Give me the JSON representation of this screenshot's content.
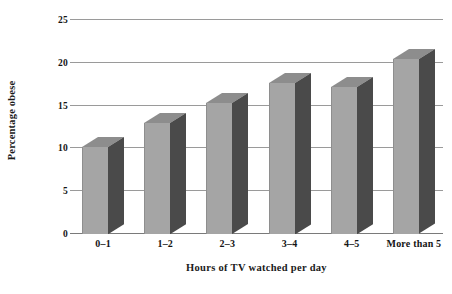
{
  "chart_data": {
    "type": "bar",
    "title": "",
    "subtitle": "",
    "xlabel": "Hours of TV watched per day",
    "ylabel": "Percentage obese",
    "categories": [
      "0–1",
      "1–2",
      "2–3",
      "3–4",
      "4–5",
      "More than 5"
    ],
    "values": [
      10.2,
      13.0,
      15.3,
      17.7,
      17.2,
      20.4
    ],
    "series": [
      {
        "name": "Percentage obese",
        "values": [
          10.2,
          13.0,
          15.3,
          17.7,
          17.2,
          20.4
        ]
      }
    ],
    "ylim": [
      0,
      25
    ],
    "xlim": null,
    "y_ticks": [
      0,
      5,
      10,
      15,
      20,
      25
    ],
    "y_tick_labels": [
      "0",
      "5",
      "10",
      "15",
      "20",
      "25"
    ],
    "grid": "horizontal",
    "legend": "none",
    "legend_position": "none",
    "style": "3d-bar",
    "annotations": []
  },
  "colors": {
    "bar_front": "#a5a5a5",
    "bar_side": "#4a4a4a",
    "bar_top": "#8d8d8d",
    "gridline": "#9a9a9a",
    "axis": "#7a7a7a",
    "text": "#141414",
    "background": "#ffffff"
  }
}
